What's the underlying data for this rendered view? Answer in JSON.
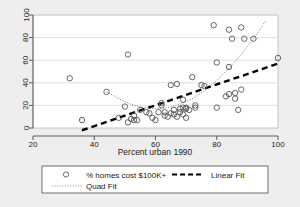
{
  "chart_data": {
    "type": "scatter",
    "title": "",
    "xlabel": "Percent urban 1990",
    "ylabel": "",
    "xlim": [
      20,
      100
    ],
    "ylim": [
      0,
      100
    ],
    "xticks": [
      20,
      40,
      60,
      80,
      100
    ],
    "yticks": [
      0,
      20,
      40,
      60,
      80,
      100
    ],
    "xtick_labels": [
      "20",
      "40",
      "60",
      "80",
      "100"
    ],
    "ytick_labels": [
      "0",
      "20",
      "40",
      "60",
      "80",
      "100"
    ],
    "grid": "horizontal",
    "legend_position": "below",
    "background_color": "#eeeeee",
    "plot_background_color": "#ffffff",
    "marker_color": "#555555",
    "linear_fit_color": "#000000",
    "quad_fit_color": "#777777",
    "series": [
      {
        "name": "% homes cost $100K+",
        "type": "scatter",
        "marker": "open-circle",
        "points": [
          [
            32,
            44
          ],
          [
            36,
            7
          ],
          [
            44,
            32
          ],
          [
            48,
            9
          ],
          [
            50,
            19
          ],
          [
            51,
            65
          ],
          [
            51,
            5
          ],
          [
            52,
            8
          ],
          [
            53,
            11
          ],
          [
            53,
            7
          ],
          [
            54,
            7
          ],
          [
            55,
            16
          ],
          [
            57,
            14
          ],
          [
            58,
            13
          ],
          [
            59,
            9
          ],
          [
            60,
            7
          ],
          [
            61,
            14
          ],
          [
            62,
            22
          ],
          [
            62,
            20
          ],
          [
            63,
            14
          ],
          [
            63,
            11
          ],
          [
            64,
            10
          ],
          [
            65,
            38
          ],
          [
            65,
            13
          ],
          [
            66,
            12
          ],
          [
            66,
            16
          ],
          [
            67,
            10
          ],
          [
            67,
            39
          ],
          [
            68,
            14
          ],
          [
            68,
            17
          ],
          [
            69,
            18
          ],
          [
            69,
            25
          ],
          [
            69,
            12
          ],
          [
            70,
            18
          ],
          [
            70,
            17
          ],
          [
            70,
            9
          ],
          [
            71,
            16
          ],
          [
            72,
            45
          ],
          [
            73,
            20
          ],
          [
            73,
            18
          ],
          [
            75,
            38
          ],
          [
            76,
            37
          ],
          [
            79,
            91
          ],
          [
            80,
            58
          ],
          [
            80,
            18
          ],
          [
            83,
            28
          ],
          [
            84,
            87
          ],
          [
            84,
            54
          ],
          [
            84,
            30
          ],
          [
            85,
            79
          ],
          [
            86,
            31
          ],
          [
            86,
            26
          ],
          [
            87,
            16
          ],
          [
            88,
            34
          ],
          [
            88,
            89
          ],
          [
            89,
            79
          ],
          [
            92,
            79
          ],
          [
            100,
            62
          ]
        ]
      },
      {
        "name": "Linear Fit",
        "type": "line",
        "style": "dashed",
        "endpoints": [
          [
            36,
            -2
          ],
          [
            100,
            57
          ]
        ]
      },
      {
        "name": "Quad Fit",
        "type": "line",
        "style": "dotted",
        "curve": [
          [
            44,
            32
          ],
          [
            48,
            26
          ],
          [
            52,
            21
          ],
          [
            56,
            18
          ],
          [
            60,
            17
          ],
          [
            64,
            18
          ],
          [
            68,
            21
          ],
          [
            72,
            26
          ],
          [
            76,
            33
          ],
          [
            80,
            42
          ],
          [
            84,
            53
          ],
          [
            88,
            65
          ],
          [
            92,
            79
          ],
          [
            96,
            95
          ]
        ]
      }
    ],
    "legend": [
      {
        "label": "% homes cost $100K+",
        "marker": "open-circle"
      },
      {
        "label": "Linear Fit",
        "marker": "dashed-line"
      },
      {
        "label": "Quad Fit",
        "marker": "dotted-line"
      }
    ]
  }
}
